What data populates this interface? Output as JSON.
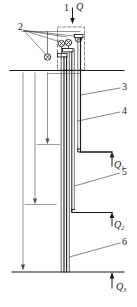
{
  "diagram": {
    "type": "engineering-schematic",
    "background_color": "#ffffff",
    "line_color": "#1a1a1a",
    "width": 137,
    "height": 307
  },
  "labels": {
    "callout_1": "1",
    "callout_2": "2",
    "callout_3": "3",
    "callout_4": "4",
    "callout_5": "5",
    "callout_6": "6"
  },
  "flows": {
    "inlet": {
      "symbol": "Q",
      "direction": "down",
      "position": "top"
    },
    "outlet_1": {
      "symbol": "Q",
      "subscript": "1",
      "direction": "up"
    },
    "outlet_2": {
      "symbol": "Q",
      "subscript": "2",
      "direction": "up"
    },
    "outlet_3": {
      "symbol": "Q",
      "subscript": "3",
      "direction": "up"
    }
  },
  "colors": {
    "stroke": "#1a1a1a",
    "thin_stroke": "#4d4d4d",
    "dashed": "#555555",
    "fill": "#ffffff"
  }
}
